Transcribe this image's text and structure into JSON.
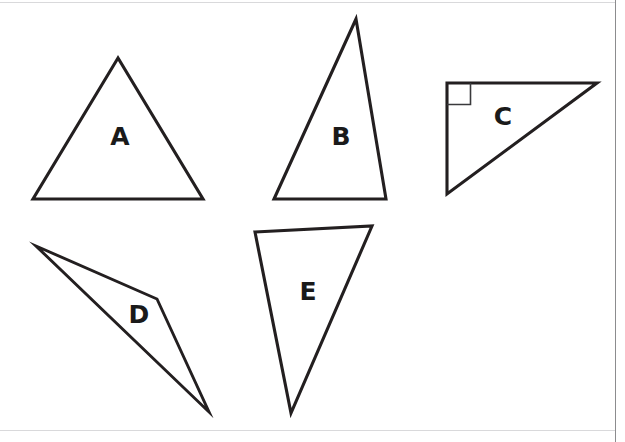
{
  "page": {
    "width": 625,
    "height": 442,
    "background_color": "#ffffff",
    "stroke_color": "#231f20",
    "label_color": "#1a1a1a",
    "frame_color": "#8c8c8e"
  },
  "frame": {
    "right_rule_x": 615.5,
    "top_rule_y": 2.5,
    "bottom_rule_y": 430.5
  },
  "figure": {
    "shapes": [
      {
        "id": "A",
        "label": "A",
        "kind": "triangle",
        "description": "acute isosceles triangle, apex up",
        "points": "118,58 33,199 203,199",
        "label_x": 120,
        "label_y": 136,
        "right_angle_marker": false
      },
      {
        "id": "B",
        "label": "B",
        "kind": "triangle",
        "description": "tall scalene triangle, apex up and right of center",
        "points": "356,19 274,199 386,199",
        "label_x": 341,
        "label_y": 136,
        "right_angle_marker": false
      },
      {
        "id": "C",
        "label": "C",
        "kind": "triangle",
        "description": "right triangle with the right angle at the top-left vertex",
        "points": "447,83 597,83 447,194",
        "label_x": 503,
        "label_y": 116,
        "right_angle_marker": true,
        "marker_path": "M 447,104.5 L 470.5,104.5 L 470.5,83"
      },
      {
        "id": "D",
        "label": "D",
        "kind": "triangle",
        "description": "very thin obtuse sliver triangle angled down-right",
        "points": "36,246 157,299 209,412",
        "label_x": 139,
        "label_y": 314,
        "right_angle_marker": false
      },
      {
        "id": "E",
        "label": "E",
        "kind": "triangle",
        "description": "inverted scalene triangle pointing down",
        "points": "255,232 372,226 291,413",
        "label_x": 308,
        "label_y": 291,
        "right_angle_marker": false
      }
    ]
  }
}
